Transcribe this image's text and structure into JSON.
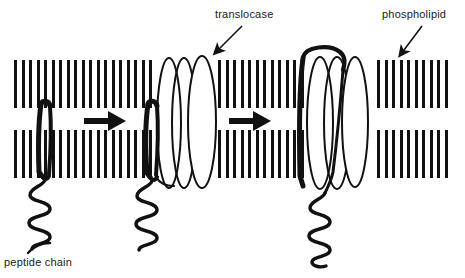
{
  "figure": {
    "background_color": "#ffffff",
    "ink_color": "#111111",
    "width": 465,
    "height": 278
  },
  "labels": {
    "translocase": "translocase",
    "phospholipid": "phospholipid",
    "peptide_chain": "peptide chain"
  },
  "callouts": [
    {
      "name": "translocase-callout",
      "text": "translocase",
      "text_x": 215,
      "text_y": 8,
      "arrow_from": [
        242,
        26
      ],
      "arrow_to": [
        215,
        54
      ]
    },
    {
      "name": "phospholipid-callout",
      "text": "phospholipid",
      "text_x": 382,
      "text_y": 8,
      "arrow_from": [
        422,
        26
      ],
      "arrow_to": [
        400,
        56
      ]
    },
    {
      "name": "peptide-chain-callout",
      "text": "peptide chain",
      "text_x": 4,
      "text_y": 256,
      "arrow_from": [
        30,
        252
      ],
      "arrow_to": [
        48,
        244
      ]
    }
  ],
  "membrane": {
    "name": "phospholipid-bilayer",
    "x_start": 14,
    "x_end": 447,
    "upper_leaflet": {
      "top": 60,
      "bottom": 108
    },
    "lower_leaflet": {
      "top": 130,
      "bottom": 178
    },
    "tail_width": 3,
    "tail_spacing": 7.4,
    "color": "#111111",
    "gaps": [
      {
        "from": 150,
        "to": 215
      },
      {
        "from": 292,
        "to": 372
      }
    ]
  },
  "stages": [
    {
      "index": 1,
      "name": "stage-peptide-inserted",
      "description": "peptide chain hairpin inserted in bilayer with coil below",
      "peptide_x": 45,
      "has_translocase": false
    },
    {
      "index": 2,
      "name": "stage-peptide-meets-translocase",
      "description": "peptide chain adjacent to translocase channel",
      "peptide_x": 152,
      "has_translocase": true,
      "translocase_center_x": 186
    },
    {
      "index": 3,
      "name": "stage-peptide-threading-translocase",
      "description": "peptide chain loops over and threads through translocase",
      "peptide_x": 303,
      "has_translocase": true,
      "translocase_center_x": 336
    }
  ],
  "translocase_units": [
    {
      "name": "translocase-helix-left",
      "cx": 169,
      "cy": 123,
      "rx": 12,
      "ry": 65
    },
    {
      "name": "translocase-helix-middle",
      "cx": 184,
      "cy": 123,
      "rx": 12,
      "ry": 65
    },
    {
      "name": "translocase-helix-right",
      "cx": 202,
      "cy": 122,
      "rx": 14,
      "ry": 66
    },
    {
      "name": "translocase-helix-left-2",
      "cx": 320,
      "cy": 123,
      "rx": 13,
      "ry": 66
    },
    {
      "name": "translocase-helix-middle-2",
      "cx": 337,
      "cy": 123,
      "rx": 13,
      "ry": 66
    },
    {
      "name": "translocase-helix-right-2",
      "cx": 355,
      "cy": 122,
      "rx": 13,
      "ry": 65
    }
  ],
  "process_arrows": [
    {
      "name": "process-arrow-1",
      "x_start": 84,
      "x_end": 124,
      "y": 121
    },
    {
      "name": "process-arrow-2",
      "x_start": 229,
      "x_end": 269,
      "y": 121
    }
  ]
}
